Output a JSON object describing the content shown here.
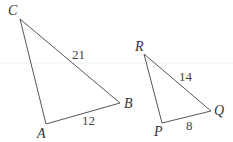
{
  "diagram": {
    "triangle_abc": {
      "vertices": {
        "A": "A",
        "B": "B",
        "C": "C"
      },
      "sides": {
        "CB": "21",
        "AB": "12"
      }
    },
    "triangle_pqr": {
      "vertices": {
        "P": "P",
        "Q": "Q",
        "R": "R"
      },
      "sides": {
        "RQ": "14",
        "PQ": "8"
      }
    },
    "colors": {
      "stroke": "#555555",
      "text": "#333333"
    }
  }
}
